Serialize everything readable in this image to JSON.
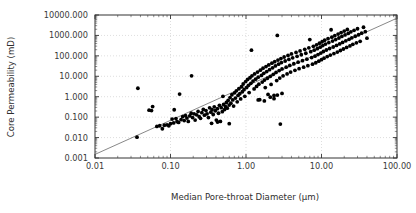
{
  "chart_data": {
    "type": "scatter",
    "title": "",
    "xlabel": "Median Pore-throat Diameter (µm)",
    "ylabel": "Core Permeability (mD)",
    "xscale": "log",
    "yscale": "log",
    "xlim": [
      0.01,
      100.0
    ],
    "ylim": [
      0.001,
      10000.0
    ],
    "grid": true,
    "grid_style": "dotted",
    "legend": null,
    "marker": "filled-circle",
    "marker_color": "#000000",
    "xticks": [
      0.01,
      0.1,
      1.0,
      10.0,
      100.0
    ],
    "xtick_labels": [
      "0.01",
      "0.10",
      "1.00",
      "10.00",
      "100.00"
    ],
    "yticks": [
      0.001,
      0.01,
      0.1,
      1.0,
      10.0,
      100.0,
      1000.0,
      10000.0
    ],
    "ytick_labels": [
      "0.001",
      "0.010",
      "0.100",
      "1.000",
      "10.000",
      "100.000",
      "1000.000",
      "10000.000"
    ],
    "trend_line": {
      "type": "power-law",
      "color": "#555555",
      "x_start": 0.01,
      "y_start": 0.0015,
      "x_end": 100.0,
      "y_end": 7000.0
    },
    "n_points": 221,
    "points": [
      [
        0.036,
        0.0105
      ],
      [
        0.037,
        2.6
      ],
      [
        0.052,
        0.22
      ],
      [
        0.056,
        0.21
      ],
      [
        0.058,
        0.33
      ],
      [
        0.066,
        0.035
      ],
      [
        0.072,
        0.038
      ],
      [
        0.078,
        0.027
      ],
      [
        0.083,
        0.04
      ],
      [
        0.09,
        0.042
      ],
      [
        0.095,
        0.038
      ],
      [
        0.1,
        0.048
      ],
      [
        0.105,
        0.08
      ],
      [
        0.11,
        0.052
      ],
      [
        0.112,
        0.23
      ],
      [
        0.118,
        0.085
      ],
      [
        0.122,
        0.06
      ],
      [
        0.128,
        0.055
      ],
      [
        0.132,
        1.35
      ],
      [
        0.138,
        0.075
      ],
      [
        0.145,
        0.105
      ],
      [
        0.152,
        0.068
      ],
      [
        0.158,
        0.12
      ],
      [
        0.165,
        0.09
      ],
      [
        0.172,
        0.062
      ],
      [
        0.18,
        0.115
      ],
      [
        0.188,
        0.155
      ],
      [
        0.19,
        10.5
      ],
      [
        0.196,
        0.095
      ],
      [
        0.205,
        0.145
      ],
      [
        0.212,
        0.072
      ],
      [
        0.222,
        0.13
      ],
      [
        0.232,
        0.19
      ],
      [
        0.24,
        0.105
      ],
      [
        0.25,
        0.088
      ],
      [
        0.26,
        0.165
      ],
      [
        0.272,
        0.24
      ],
      [
        0.282,
        0.125
      ],
      [
        0.295,
        0.21
      ],
      [
        0.305,
        0.145
      ],
      [
        0.318,
        0.095
      ],
      [
        0.33,
        0.285
      ],
      [
        0.342,
        0.175
      ],
      [
        0.355,
        0.23
      ],
      [
        0.368,
        0.135
      ],
      [
        0.38,
        0.32
      ],
      [
        0.392,
        0.205
      ],
      [
        0.405,
        0.072
      ],
      [
        0.418,
        0.26
      ],
      [
        0.432,
        0.155
      ],
      [
        0.445,
        0.38
      ],
      [
        0.458,
        0.062
      ],
      [
        0.47,
        0.29
      ],
      [
        0.485,
        0.185
      ],
      [
        0.495,
        1.05
      ],
      [
        0.505,
        0.42
      ],
      [
        0.52,
        0.235
      ],
      [
        0.535,
        0.33
      ],
      [
        0.55,
        0.52
      ],
      [
        0.565,
        0.275
      ],
      [
        0.58,
        0.66
      ],
      [
        0.598,
        0.39
      ],
      [
        0.615,
        0.91
      ],
      [
        0.63,
        0.48
      ],
      [
        0.65,
        1.25
      ],
      [
        0.668,
        0.7
      ],
      [
        0.685,
        0.35
      ],
      [
        0.705,
        1.55
      ],
      [
        0.725,
        0.86
      ],
      [
        0.745,
        1.95
      ],
      [
        0.765,
        0.56
      ],
      [
        0.785,
        1.15
      ],
      [
        0.805,
        2.45
      ],
      [
        0.828,
        1.4
      ],
      [
        0.85,
        0.78
      ],
      [
        0.872,
        3.1
      ],
      [
        0.895,
        1.75
      ],
      [
        0.918,
        4.2
      ],
      [
        0.942,
        2.2
      ],
      [
        0.965,
        1.05
      ],
      [
        0.99,
        5.5
      ],
      [
        1.02,
        2.8
      ],
      [
        1.05,
        7.0
      ],
      [
        1.08,
        3.6
      ],
      [
        1.1,
        1.6
      ],
      [
        1.13,
        8.5
      ],
      [
        1.16,
        4.5
      ],
      [
        1.18,
        190.0
      ],
      [
        1.2,
        10.5
      ],
      [
        1.24,
        5.8
      ],
      [
        1.28,
        2.4
      ],
      [
        1.3,
        13.0
      ],
      [
        1.34,
        7.2
      ],
      [
        1.38,
        3.2
      ],
      [
        1.42,
        16.0
      ],
      [
        1.45,
        9.0
      ],
      [
        1.48,
        4.1
      ],
      [
        1.52,
        0.72
      ],
      [
        1.55,
        20.0
      ],
      [
        1.6,
        11.0
      ],
      [
        1.64,
        5.2
      ],
      [
        1.68,
        25.0
      ],
      [
        1.72,
        14.0
      ],
      [
        1.76,
        6.5
      ],
      [
        1.8,
        2.8
      ],
      [
        1.84,
        30.0
      ],
      [
        1.88,
        17.0
      ],
      [
        1.92,
        8.0
      ],
      [
        1.96,
        1.3
      ],
      [
        2.0,
        36.0
      ],
      [
        2.05,
        21.0
      ],
      [
        2.1,
        10.0
      ],
      [
        2.15,
        4.0
      ],
      [
        2.2,
        44.0
      ],
      [
        2.25,
        26.0
      ],
      [
        2.3,
        12.5
      ],
      [
        2.35,
        1.15
      ],
      [
        2.4,
        52.0
      ],
      [
        2.45,
        32.0
      ],
      [
        2.5,
        15.5
      ],
      [
        2.55,
        6.2
      ],
      [
        2.6,
        1000.0
      ],
      [
        2.65,
        62.0
      ],
      [
        2.7,
        39.0
      ],
      [
        2.75,
        19.0
      ],
      [
        2.8,
        8.2
      ],
      [
        2.85,
        0.046
      ],
      [
        2.9,
        74.0
      ],
      [
        2.95,
        47.0
      ],
      [
        3.0,
        23.0
      ],
      [
        3.1,
        10.5
      ],
      [
        3.2,
        88.0
      ],
      [
        3.3,
        56.0
      ],
      [
        3.4,
        28.0
      ],
      [
        3.5,
        13.0
      ],
      [
        3.6,
        105.0
      ],
      [
        3.7,
        67.0
      ],
      [
        3.8,
        34.0
      ],
      [
        3.9,
        16.0
      ],
      [
        4.0,
        125.0
      ],
      [
        4.15,
        80.0
      ],
      [
        4.3,
        41.0
      ],
      [
        4.45,
        19.5
      ],
      [
        4.6,
        148.0
      ],
      [
        4.75,
        95.0
      ],
      [
        4.9,
        49.0
      ],
      [
        5.05,
        23.5
      ],
      [
        5.2,
        175.0
      ],
      [
        5.4,
        113.0
      ],
      [
        5.6,
        58.0
      ],
      [
        5.8,
        28.0
      ],
      [
        6.0,
        208.0
      ],
      [
        6.2,
        134.0
      ],
      [
        6.4,
        69.0
      ],
      [
        6.6,
        33.0
      ],
      [
        6.8,
        247.0
      ],
      [
        7.0,
        630.0
      ],
      [
        7.2,
        160.0
      ],
      [
        7.4,
        82.0
      ],
      [
        7.6,
        39.0
      ],
      [
        7.8,
        293.0
      ],
      [
        8.0,
        190.0
      ],
      [
        8.2,
        97.0
      ],
      [
        8.4,
        46.0
      ],
      [
        8.6,
        348.0
      ],
      [
        8.8,
        225.0
      ],
      [
        9.0,
        115.0
      ],
      [
        9.2,
        55.0
      ],
      [
        9.4,
        413.0
      ],
      [
        9.6,
        267.0
      ],
      [
        9.8,
        137.0
      ],
      [
        10.0,
        65.0
      ],
      [
        10.2,
        490.0
      ],
      [
        10.4,
        317.0
      ],
      [
        10.6,
        163.0
      ],
      [
        10.8,
        77.0
      ],
      [
        11.0,
        580.0
      ],
      [
        11.3,
        376.0
      ],
      [
        11.6,
        193.0
      ],
      [
        11.9,
        92.0
      ],
      [
        12.2,
        690.0
      ],
      [
        12.5,
        446.0
      ],
      [
        12.8,
        229.0
      ],
      [
        13.1,
        109.0
      ],
      [
        13.4,
        1900.0
      ],
      [
        13.7,
        820.0
      ],
      [
        14.0,
        530.0
      ],
      [
        14.3,
        272.0
      ],
      [
        14.6,
        130.0
      ],
      [
        15.0,
        975.0
      ],
      [
        15.4,
        630.0
      ],
      [
        15.8,
        323.0
      ],
      [
        16.2,
        154.0
      ],
      [
        16.6,
        1160.0
      ],
      [
        17.0,
        750.0
      ],
      [
        17.4,
        384.0
      ],
      [
        17.8,
        183.0
      ],
      [
        18.2,
        1380.0
      ],
      [
        18.6,
        890.0
      ],
      [
        19.0,
        456.0
      ],
      [
        19.5,
        217.0
      ],
      [
        20.0,
        1640.0
      ],
      [
        20.5,
        1060.0
      ],
      [
        21.0,
        542.0
      ],
      [
        21.5,
        258.0
      ],
      [
        22.0,
        1950.0
      ],
      [
        22.6,
        1260.0
      ],
      [
        23.2,
        644.0
      ],
      [
        23.8,
        307.0
      ],
      [
        24.5,
        1500.0
      ],
      [
        25.2,
        765.0
      ],
      [
        26.0,
        365.0
      ],
      [
        27.0,
        1780.0
      ],
      [
        28.0,
        910.0
      ],
      [
        29.0,
        434.0
      ],
      [
        30.0,
        2120.0
      ],
      [
        31.0,
        1080.0
      ],
      [
        32.5,
        515.0
      ],
      [
        34.0,
        1290.0
      ],
      [
        36.0,
        2520.0
      ],
      [
        38.0,
        1530.0
      ],
      [
        40.0,
        730.0
      ],
      [
        1.45,
        0.7
      ],
      [
        2.1,
        0.95
      ],
      [
        2.6,
        1.2
      ],
      [
        3.0,
        1.45
      ],
      [
        1.75,
        0.62
      ],
      [
        2.35,
        0.8
      ],
      [
        0.6,
        0.048
      ],
      [
        0.42,
        0.058
      ],
      [
        0.35,
        0.05
      ]
    ]
  },
  "axes": {
    "x_title": "Median Pore-throat Diameter (µm)",
    "y_title": "Core Permeability (mD)"
  }
}
